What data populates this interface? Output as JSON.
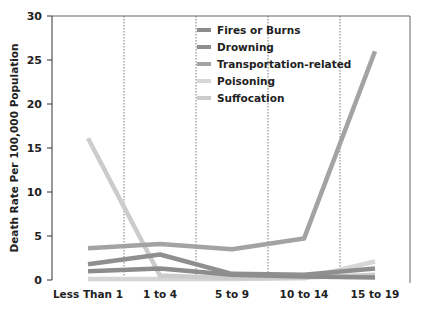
{
  "chart_data": {
    "type": "line",
    "title": "",
    "xlabel": "",
    "ylabel": "Death Rate Per 100,000 Population",
    "ylim": [
      0,
      30
    ],
    "yticks": [
      0,
      5,
      10,
      15,
      20,
      25,
      30
    ],
    "categories": [
      "Less Than 1",
      "1 to 4",
      "5 to 9",
      "10 to 14",
      "15 to 19"
    ],
    "grid": "vertical dotted separators between categories",
    "legend_position": "top-center inside plot",
    "series": [
      {
        "name": "Fires or Burns",
        "color": "#8c8c8c",
        "values": [
          1.0,
          1.3,
          0.6,
          0.4,
          0.3
        ]
      },
      {
        "name": "Drowning",
        "color": "#8f8f8f",
        "values": [
          1.8,
          2.9,
          0.7,
          0.6,
          1.3
        ]
      },
      {
        "name": "Transportation-related",
        "color": "#a3a3a3",
        "values": [
          3.6,
          4.1,
          3.5,
          4.7,
          26.0
        ]
      },
      {
        "name": "Poisoning",
        "color": "#d6d6d6",
        "values": [
          0.1,
          0.1,
          0.1,
          0.2,
          2.1
        ]
      },
      {
        "name": "Suffocation",
        "color": "#cccccc",
        "values": [
          16.1,
          0.5,
          0.2,
          0.3,
          0.6
        ]
      }
    ]
  }
}
